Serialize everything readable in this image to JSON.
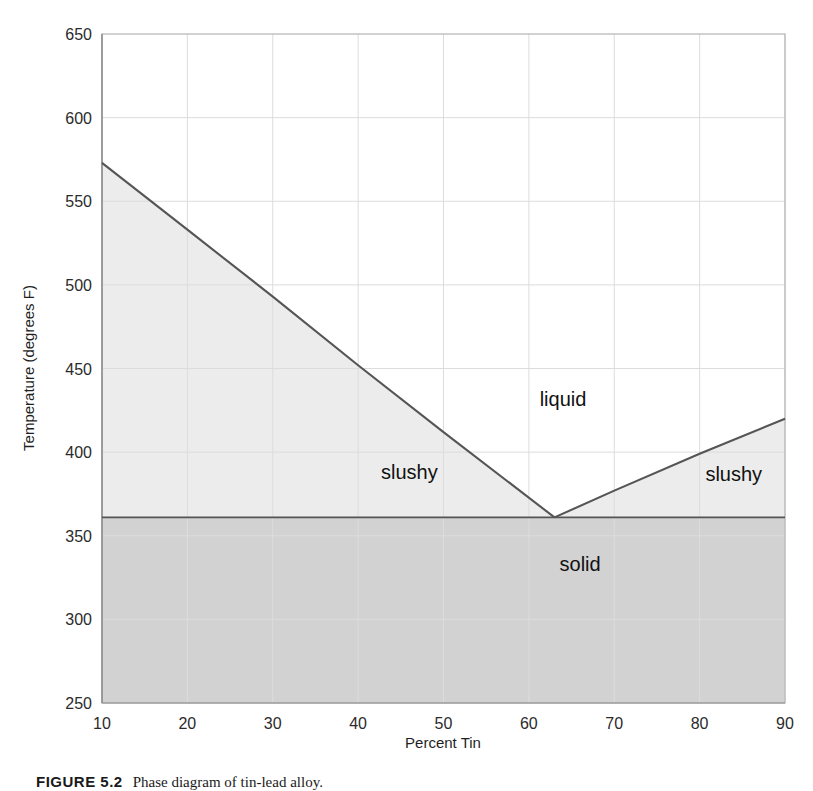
{
  "chart_data": {
    "type": "line",
    "title": "",
    "xlabel": "Percent Tin",
    "ylabel": "Temperature (degrees F)",
    "xlim": [
      10,
      90
    ],
    "ylim": [
      250,
      650
    ],
    "xticks": [
      10,
      20,
      30,
      40,
      50,
      60,
      70,
      80,
      90
    ],
    "yticks": [
      250,
      300,
      350,
      400,
      450,
      500,
      550,
      600,
      650
    ],
    "grid": true,
    "legend_position": "none",
    "series": [
      {
        "name": "liquidus-left",
        "x": [
          10,
          20,
          30,
          40,
          50,
          63
        ],
        "values": [
          573,
          533,
          493,
          452,
          412,
          361
        ]
      },
      {
        "name": "liquidus-right",
        "x": [
          63,
          70,
          80,
          90
        ],
        "values": [
          361,
          377,
          399,
          420
        ]
      },
      {
        "name": "solidus",
        "x": [
          10,
          90
        ],
        "values": [
          361,
          361
        ]
      }
    ],
    "eutectic_point": {
      "x": 63,
      "y": 361
    },
    "annotations": [
      {
        "text": "liquid",
        "x": 64,
        "y": 432
      },
      {
        "text": "slushy",
        "x": 46,
        "y": 388
      },
      {
        "text": "slushy",
        "x": 84,
        "y": 387
      },
      {
        "text": "solid",
        "x": 66,
        "y": 333
      }
    ],
    "region_colors": {
      "liquid": "#ffffff",
      "slushy": "#ececec",
      "solid": "#d2d2d2",
      "curve": "#555555",
      "grid": "#d9d9d9",
      "axis": "#9a9a9a"
    }
  },
  "caption": {
    "number": "FIGURE 5.2",
    "text": "Phase diagram of tin-lead alloy."
  }
}
